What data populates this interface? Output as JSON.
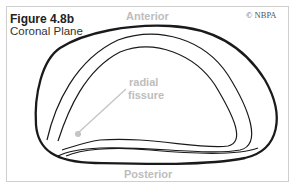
{
  "figure": {
    "title": "Figure 4.8b",
    "subtitle": "Coronal Plane",
    "copyright": "© NBPA"
  },
  "labels": {
    "anterior": "Anterior",
    "posterior": "Posterior",
    "fissure_line1": "radial",
    "fissure_line2": "fissure"
  },
  "colors": {
    "outline": "#1a1a1a",
    "label_gray": "#bdbdbd",
    "pointer_gray": "#c4c4c4",
    "frame": "#cfcfcf"
  }
}
